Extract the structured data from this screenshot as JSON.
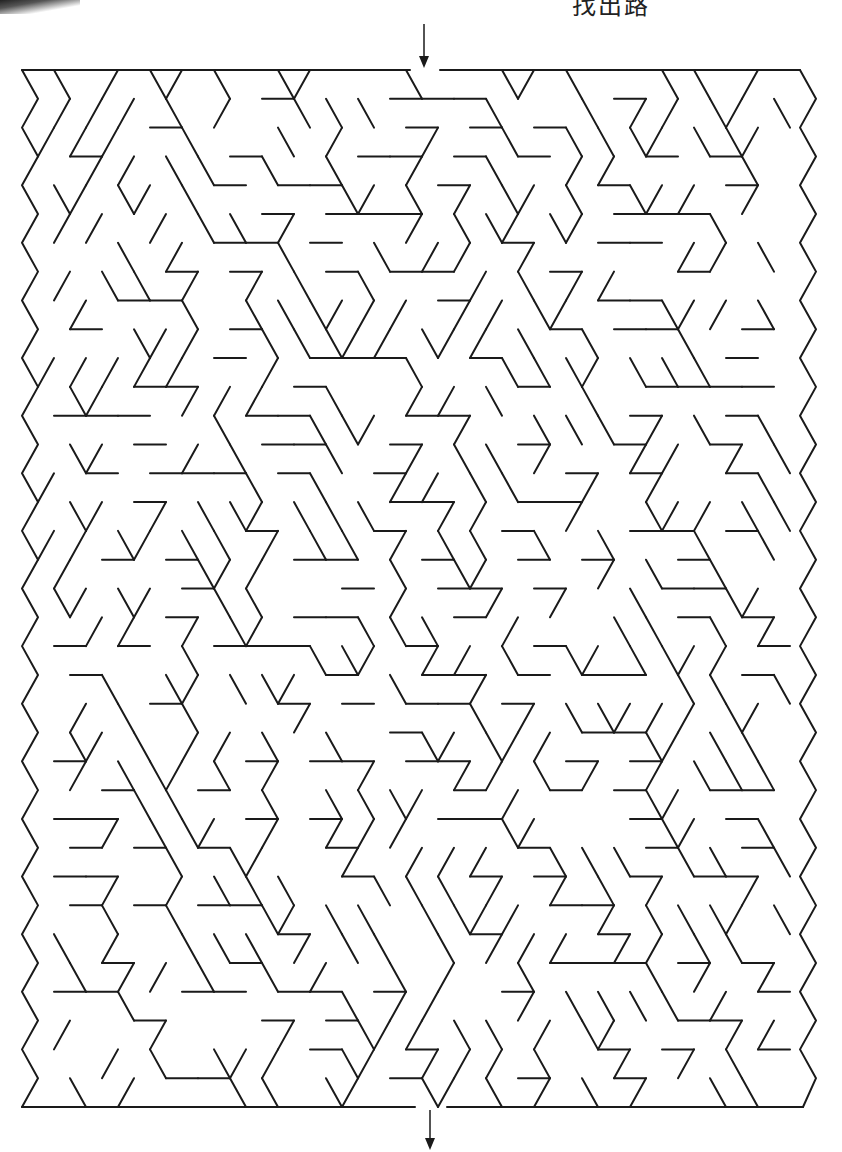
{
  "page": {
    "title_fragment": "找出路",
    "colors": {
      "ink": "#1a1a1a",
      "paper": "#ffffff"
    }
  },
  "maze": {
    "type": "triangular-lattice maze",
    "bounds": {
      "left": 22,
      "top": 70,
      "right": 816,
      "bottom": 1107
    },
    "entrance": {
      "label": "start-arrow",
      "direction": "down",
      "x": 424,
      "gap": [
        410,
        440
      ]
    },
    "exit": {
      "label": "finish-arrow",
      "direction": "down",
      "x": 430,
      "gap": [
        415,
        447
      ]
    },
    "grid": {
      "col_step": 32,
      "row_step": 29,
      "rows": 36
    }
  }
}
